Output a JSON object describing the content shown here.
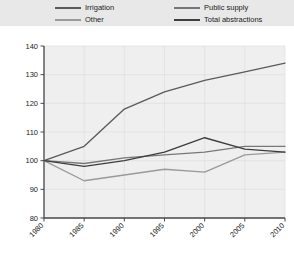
{
  "legend": {
    "entries": [
      {
        "label": "Irrigation",
        "color": "#5a5a5a",
        "column": "left",
        "swatch_name": "legend-swatch-irrigation"
      },
      {
        "label": "Other",
        "color": "#9a9a9a",
        "column": "left",
        "swatch_name": "legend-swatch-other"
      },
      {
        "label": "Public supply",
        "color": "#777777",
        "column": "right",
        "swatch_name": "legend-swatch-public-supply"
      },
      {
        "label": "Total abstractions",
        "color": "#3d3d3d",
        "column": "right",
        "swatch_name": "legend-swatch-total-abstractions"
      }
    ]
  },
  "chart_data": {
    "type": "line",
    "title": "",
    "subtitle": "",
    "xlabel": "",
    "ylabel": "",
    "x": [
      1980,
      1985,
      1990,
      1995,
      2000,
      2005,
      2010
    ],
    "categories": [
      "1980",
      "1985",
      "1990",
      "1995",
      "2000",
      "2005",
      "2010"
    ],
    "xlim": [
      1980,
      2010
    ],
    "ylim": [
      80,
      140
    ],
    "yticks": [
      80,
      90,
      100,
      110,
      120,
      130,
      140
    ],
    "ytick_labels": [
      "80",
      "90",
      "100",
      "110",
      "120",
      "130",
      "140"
    ],
    "xticks": [
      1980,
      1985,
      1990,
      1995,
      2000,
      2005,
      2010
    ],
    "xtick_labels": [
      "1980",
      "1985",
      "1990",
      "1995",
      "2000",
      "2005",
      "2010"
    ],
    "grid": true,
    "legend_position": "top",
    "series": [
      {
        "name": "Irrigation",
        "color": "#5a5a5a",
        "values": [
          100,
          105,
          118,
          124,
          128,
          131,
          134
        ]
      },
      {
        "name": "Other",
        "color": "#9a9a9a",
        "values": [
          100,
          93,
          95,
          97,
          96,
          102,
          103
        ]
      },
      {
        "name": "Public supply",
        "color": "#777777",
        "values": [
          100,
          99,
          101,
          102,
          103,
          105,
          105
        ]
      },
      {
        "name": "Total abstractions",
        "color": "#3d3d3d",
        "values": [
          100,
          98,
          100,
          103,
          108,
          104,
          103
        ]
      }
    ]
  }
}
